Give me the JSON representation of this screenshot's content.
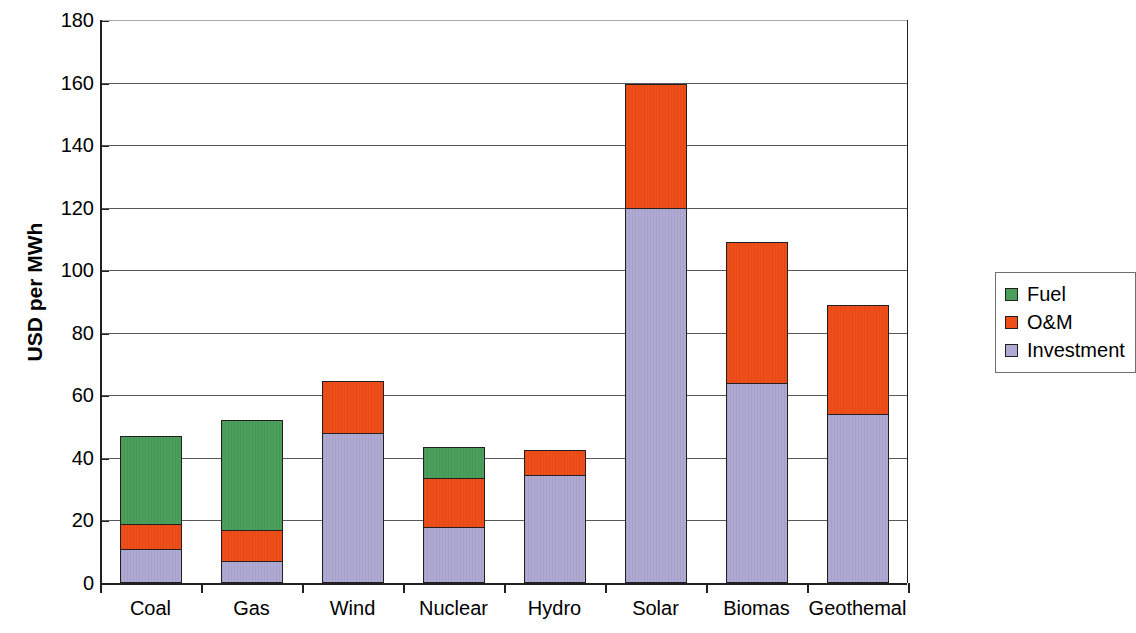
{
  "chart_data": {
    "type": "bar",
    "subtype": "stacked-bar",
    "title": "",
    "xlabel": "",
    "ylabel": "USD per MWh",
    "ylim": [
      0,
      180
    ],
    "ytick_step": 20,
    "yticks": [
      0,
      20,
      40,
      60,
      80,
      100,
      120,
      140,
      160,
      180
    ],
    "ytick_labels": [
      "0",
      "20",
      "40",
      "60",
      "80",
      "100",
      "120",
      "140",
      "160",
      "180"
    ],
    "grid": true,
    "grid_axis": "y",
    "legend_position": "right",
    "categories": [
      "Coal",
      "Gas",
      "Wind",
      "Nuclear",
      "Hydro",
      "Solar",
      "Biomas",
      "Geothemal"
    ],
    "series": [
      {
        "name": "Investment",
        "color": "#aeaad3",
        "values": [
          11,
          7,
          48,
          18,
          34.5,
          120,
          64,
          54
        ]
      },
      {
        "name": "O&M",
        "color": "#f04e18",
        "values": [
          8,
          10,
          16.5,
          15.5,
          8,
          39.5,
          45,
          35
        ]
      },
      {
        "name": "Fuel",
        "color": "#4aa05a",
        "values": [
          28,
          35,
          0,
          10,
          0,
          0,
          0,
          0
        ]
      }
    ],
    "stack_order_bottom_to_top": [
      "Investment",
      "O&M",
      "Fuel"
    ],
    "totals": [
      47,
      52,
      64.5,
      43.5,
      42.5,
      159.5,
      109,
      89
    ]
  },
  "legend": {
    "items": [
      {
        "label": "Fuel",
        "color": "#4aa05a"
      },
      {
        "label": "O&M",
        "color": "#f04e18"
      },
      {
        "label": "Investment",
        "color": "#aeaad3"
      }
    ]
  },
  "axis": {
    "y_title": "USD per MWh"
  }
}
